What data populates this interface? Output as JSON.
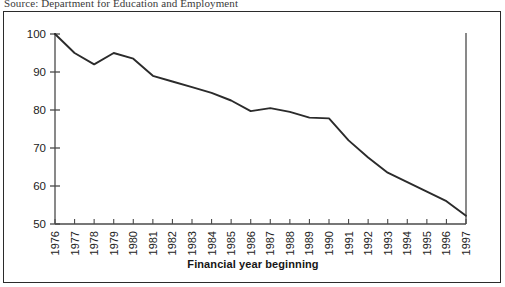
{
  "source": {
    "text": "Source: Department for Education and Employment"
  },
  "chart_data": {
    "type": "line",
    "title": "",
    "xlabel": "Financial year beginning",
    "ylabel": "",
    "categories": [
      "1976",
      "1977",
      "1978",
      "1979",
      "1980",
      "1981",
      "1982",
      "1983",
      "1984",
      "1985",
      "1986",
      "1987",
      "1988",
      "1989",
      "1990",
      "1991",
      "1992",
      "1993",
      "1994",
      "1995",
      "1996",
      "1997"
    ],
    "values": [
      100.0,
      95.0,
      92.0,
      95.0,
      93.5,
      89.0,
      87.5,
      86.0,
      84.5,
      82.5,
      79.7,
      80.5,
      79.5,
      78.0,
      77.8,
      72.0,
      67.5,
      63.5,
      61.0,
      58.5,
      56.0,
      52.2
    ],
    "series": [
      {
        "name": "Index",
        "values": [
          100.0,
          95.0,
          92.0,
          95.0,
          93.5,
          89.0,
          87.5,
          86.0,
          84.5,
          82.5,
          79.7,
          80.5,
          79.5,
          78.0,
          77.8,
          72.0,
          67.5,
          63.5,
          61.0,
          58.5,
          56.0,
          52.2
        ]
      }
    ],
    "ylim": [
      50,
      100
    ],
    "yticks": [
      50,
      60,
      70,
      80,
      90,
      100
    ],
    "ytick_labels": [
      "50",
      "60",
      "70",
      "80",
      "90",
      "100"
    ],
    "grid": false,
    "legend": "none",
    "line_color": "#2b2b2b",
    "axis_color": "#4a4a4a"
  }
}
